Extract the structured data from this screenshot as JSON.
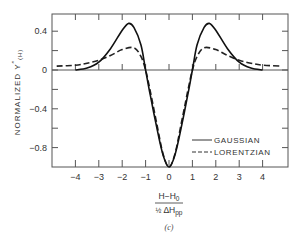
{
  "chart_data": {
    "type": "line",
    "title": "",
    "xlabel_numerator": "H−H0",
    "xlabel_denominator": "½ ΔHpp",
    "ylabel": "NORMALIZED Y″(H)",
    "caption": "(c)",
    "xlim": [
      -5.1,
      5.0
    ],
    "ylim": [
      -1.0,
      0.6
    ],
    "x_ticks": [
      -4,
      -3,
      -2,
      -1,
      0,
      1,
      2,
      3,
      4
    ],
    "x_tick_labels": [
      "-4",
      "-3",
      "-2",
      "-1",
      "0",
      "1",
      "2",
      "3",
      "4"
    ],
    "y_ticks": [
      0.4,
      0,
      -0.4,
      -0.8
    ],
    "y_tick_labels": [
      "0.4",
      "0",
      "-0.4",
      "-0.8"
    ],
    "y_minor_ticks": [
      0.6,
      0.2,
      -0.2,
      -0.6
    ],
    "grid": false,
    "zero_line": true,
    "legend_position": "lower right inside",
    "series": [
      {
        "name": "GAUSSIAN",
        "style": "solid",
        "x": [
          -4.0,
          -3.5,
          -3.0,
          -2.5,
          -2.0,
          -1.73,
          -1.5,
          -1.2,
          -1.0,
          -0.8,
          -0.5,
          -0.25,
          0,
          0.25,
          0.5,
          0.8,
          1.0,
          1.2,
          1.5,
          1.73,
          2.0,
          2.5,
          3.0,
          3.5,
          4.0
        ],
        "values": [
          0.0,
          0.02,
          0.08,
          0.22,
          0.41,
          0.48,
          0.44,
          0.26,
          0.0,
          -0.26,
          -0.62,
          -0.88,
          -1.0,
          -0.88,
          -0.62,
          -0.26,
          0.0,
          0.26,
          0.44,
          0.48,
          0.41,
          0.22,
          0.08,
          0.02,
          0.0
        ]
      },
      {
        "name": "LORENTZIAN",
        "style": "dashed",
        "x": [
          -4.8,
          -4.0,
          -3.5,
          -3.0,
          -2.5,
          -2.0,
          -1.5,
          -1.2,
          -1.0,
          -0.8,
          -0.5,
          -0.25,
          0,
          0.25,
          0.5,
          0.8,
          1.0,
          1.2,
          1.5,
          2.0,
          2.5,
          3.0,
          3.5,
          4.0,
          4.8
        ],
        "values": [
          0.04,
          0.05,
          0.07,
          0.1,
          0.15,
          0.21,
          0.23,
          0.14,
          0.0,
          -0.22,
          -0.58,
          -0.87,
          -1.0,
          -0.87,
          -0.58,
          -0.22,
          0.0,
          0.14,
          0.23,
          0.21,
          0.15,
          0.1,
          0.07,
          0.05,
          0.04
        ]
      }
    ]
  },
  "legend": {
    "gaussian_label": "GAUSSIAN",
    "lorentzian_label": "LORENTZIAN"
  },
  "axes": {
    "ylabel_main": "NORMALIZED Y",
    "ylabel_sup": "″",
    "ylabel_sub": "(H)",
    "xlabel_num_main": "H−H",
    "xlabel_num_sub": "0",
    "xlabel_den_frac": "½",
    "xlabel_den_main": "ΔH",
    "xlabel_den_sub": "pp",
    "caption": "(c)"
  }
}
